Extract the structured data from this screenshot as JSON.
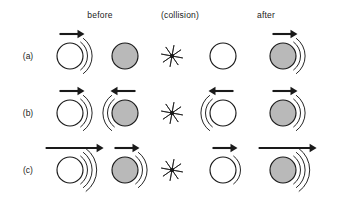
{
  "figure": {
    "title": "",
    "background_color": "#ffffff",
    "ball_white_fill": "#ffffff",
    "ball_gray_fill": "#b9b9b9",
    "stroke_color": "#1a1a1a",
    "headers": [
      {
        "label": "before",
        "x": 100
      },
      {
        "label": "(collision)",
        "x": 180
      },
      {
        "label": "after",
        "x": 266
      }
    ],
    "column_x": {
      "before_left": 70,
      "before_right": 125,
      "collision": 172,
      "after_left": 223,
      "after_right": 283
    },
    "rows": [
      {
        "label": "(a)",
        "label_x": 28,
        "center_y": 56,
        "objects": [
          {
            "name": "white-ball",
            "column": "before_left",
            "fill": "white",
            "arrow": {
              "direction": "right",
              "length": "short"
            },
            "arcs": {
              "side": "right",
              "count": 2
            }
          },
          {
            "name": "gray-ball",
            "column": "before_right",
            "fill": "gray",
            "arrow": null,
            "arcs": null
          },
          {
            "name": "collision-burst",
            "column": "collision",
            "fill": "burst",
            "arrow": null,
            "arcs": null
          },
          {
            "name": "white-ball",
            "column": "after_left",
            "fill": "white",
            "arrow": null,
            "arcs": null
          },
          {
            "name": "gray-ball",
            "column": "after_right",
            "fill": "gray",
            "arrow": {
              "direction": "right",
              "length": "short"
            },
            "arcs": {
              "side": "right",
              "count": 2
            }
          }
        ]
      },
      {
        "label": "(b)",
        "label_x": 28,
        "center_y": 113,
        "objects": [
          {
            "name": "white-ball",
            "column": "before_left",
            "fill": "white",
            "arrow": {
              "direction": "right",
              "length": "short"
            },
            "arcs": {
              "side": "right",
              "count": 2
            }
          },
          {
            "name": "gray-ball",
            "column": "before_right",
            "fill": "gray",
            "arrow": {
              "direction": "left",
              "length": "short"
            },
            "arcs": {
              "side": "left",
              "count": 2
            }
          },
          {
            "name": "collision-burst",
            "column": "collision",
            "fill": "burst",
            "arrow": null,
            "arcs": null
          },
          {
            "name": "white-ball",
            "column": "after_left",
            "fill": "white",
            "arrow": {
              "direction": "left",
              "length": "short"
            },
            "arcs": {
              "side": "left",
              "count": 2
            }
          },
          {
            "name": "gray-ball",
            "column": "after_right",
            "fill": "gray",
            "arrow": {
              "direction": "right",
              "length": "short"
            },
            "arcs": {
              "side": "right",
              "count": 2
            }
          }
        ]
      },
      {
        "label": "(c)",
        "label_x": 28,
        "center_y": 170,
        "objects": [
          {
            "name": "white-ball",
            "column": "before_left",
            "fill": "white",
            "arrow": {
              "direction": "right",
              "length": "long"
            },
            "arcs": {
              "side": "right",
              "count": 3
            }
          },
          {
            "name": "gray-ball",
            "column": "before_right",
            "fill": "gray",
            "arrow": {
              "direction": "right",
              "length": "short"
            },
            "arcs": {
              "side": "right",
              "count": 2
            }
          },
          {
            "name": "collision-burst",
            "column": "collision",
            "fill": "burst",
            "arrow": null,
            "arcs": null
          },
          {
            "name": "white-ball",
            "column": "after_left",
            "fill": "white",
            "arrow": {
              "direction": "right",
              "length": "short"
            },
            "arcs": {
              "side": "right",
              "count": 1
            }
          },
          {
            "name": "gray-ball",
            "column": "after_right",
            "fill": "gray",
            "arrow": {
              "direction": "right",
              "length": "long"
            },
            "arcs": {
              "side": "right",
              "count": 3
            }
          }
        ]
      }
    ],
    "ball_radius": 13,
    "burst_rays": 8,
    "burst_radius": 11
  }
}
